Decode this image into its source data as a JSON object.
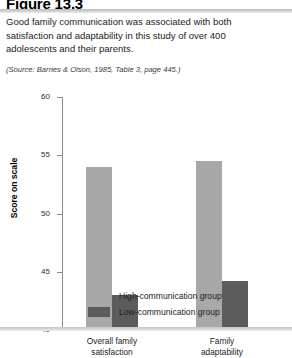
{
  "figure": {
    "title": "Figure 13.3",
    "caption": "Good family communication was associated with both satisfaction and adaptability in this study of over 400 adolescents and their parents.",
    "source": "(Source: Barnes & Olson, 1985, Table 3, page 445.)"
  },
  "colors": {
    "high_communication": "#a8a8a8",
    "low_communication": "#5c5c5c",
    "axis": "#8c8c8c",
    "rule": "#c7c7c7",
    "text": "#1a1a1a"
  },
  "chart_data": {
    "type": "bar",
    "title": "",
    "xlabel": "",
    "ylabel": "Score on scale",
    "categories": [
      "Overall family satisfaction",
      "Family adaptability"
    ],
    "category_lines": [
      [
        "Overall family",
        "satisfaction"
      ],
      [
        "Family",
        "adaptability"
      ]
    ],
    "series": [
      {
        "name": "High-communication group",
        "values": [
          54.0,
          54.5
        ],
        "color": "#a8a8a8"
      },
      {
        "name": "Low-communication group",
        "values": [
          43.0,
          44.2
        ],
        "color": "#5c5c5c"
      }
    ],
    "ylim": [
      40,
      60
    ],
    "yticks": [
      40,
      45,
      50,
      55,
      60
    ],
    "ytick_labels": [
      "40",
      "45",
      "50",
      "55",
      "60"
    ],
    "grid": false,
    "legend_position": "bottom"
  },
  "legend": {
    "items": [
      {
        "label": "High-communication group",
        "swatch": "high"
      },
      {
        "label": "Low-communication group",
        "swatch": "low"
      }
    ]
  }
}
